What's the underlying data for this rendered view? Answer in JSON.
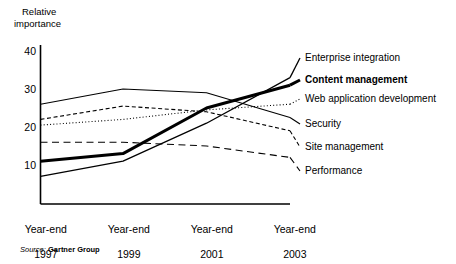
{
  "chart_data": {
    "type": "line",
    "title": "",
    "ylabel_line1": "Relative",
    "ylabel_line2": "importance",
    "xlabel": "",
    "x": [
      "Year-end 1997",
      "Year-end 1999",
      "Year-end 2001",
      "Year-end 2003"
    ],
    "categories": [
      "Year-end 1997",
      "Year-end 1999",
      "Year-end 2001",
      "Year-end 2003"
    ],
    "xtick_labels": [
      {
        "line1": "Year-end",
        "line2": "1997"
      },
      {
        "line1": "Year-end",
        "line2": "1999"
      },
      {
        "line1": "Year-end",
        "line2": "2001"
      },
      {
        "line1": "Year-end",
        "line2": "2003"
      }
    ],
    "ytick_labels": [
      "40",
      "30",
      "20",
      "10"
    ],
    "ytick_values": [
      40,
      30,
      20,
      10
    ],
    "ylim": [
      0,
      40
    ],
    "grid": false,
    "legend_position": "right-of-plot",
    "series": [
      {
        "name": "Enterprise integration",
        "values": [
          7,
          11,
          21,
          33
        ],
        "style": "solid",
        "width": 1.3,
        "emphasis": false,
        "label_y": 58
      },
      {
        "name": "Content management",
        "values": [
          11,
          13,
          25,
          31
        ],
        "style": "solid",
        "width": 3,
        "emphasis": true,
        "label_y": 80
      },
      {
        "name": "Web application development",
        "values": [
          20.5,
          22,
          24.5,
          26
        ],
        "style": "dotted",
        "width": 1.1,
        "emphasis": false,
        "label_y": 99
      },
      {
        "name": "Security",
        "values": [
          26,
          30,
          29,
          22.5
        ],
        "style": "solid",
        "width": 1.1,
        "emphasis": false,
        "label_y": 124
      },
      {
        "name": "Site management",
        "values": [
          22,
          25.5,
          24,
          19
        ],
        "style": "dashed-fine",
        "width": 1.1,
        "emphasis": false,
        "label_y": 147
      },
      {
        "name": "Performance",
        "values": [
          16,
          16,
          15,
          12
        ],
        "style": "dashed-long",
        "width": 1.1,
        "emphasis": false,
        "label_y": 171
      }
    ],
    "source_prefix": "Source:",
    "source_name": "Gartner Group",
    "colors": {
      "line": "#000000",
      "axis": "#000000",
      "background": "#ffffff"
    }
  }
}
